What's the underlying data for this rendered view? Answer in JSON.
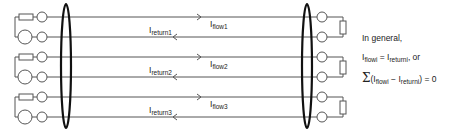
{
  "diagram": {
    "type": "circuit-current-flow",
    "pairs": [
      {
        "flow_label": "I",
        "flow_sub": "flow1",
        "return_label": "I",
        "return_sub": "return1"
      },
      {
        "flow_label": "I",
        "flow_sub": "flow2",
        "return_label": "I",
        "return_sub": "return2"
      },
      {
        "flow_label": "I",
        "flow_sub": "flow3",
        "return_label": "I",
        "return_sub": "return3"
      }
    ],
    "line_color": "#555555",
    "ellipse_color": "#111111"
  },
  "note": {
    "line1": "In general,",
    "line2_a": "I",
    "line2_a_sub": "flowi",
    "line2_eq": " = ",
    "line2_b": "I",
    "line2_b_sub": "returni",
    "line2_tail": ", or",
    "line3_sigma": "Σ",
    "line3_open": "(I",
    "line3_a_sub": "flowi",
    "line3_minus": " − I",
    "line3_b_sub": "returni",
    "line3_close": ") = 0"
  }
}
